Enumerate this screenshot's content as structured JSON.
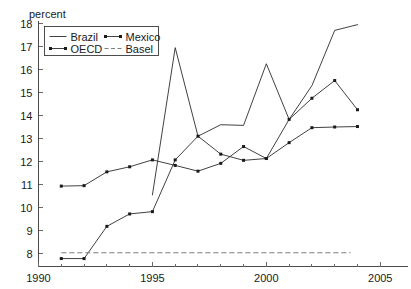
{
  "chart_data": {
    "type": "line",
    "title": "",
    "subtitle": "",
    "xlabel": "",
    "ylabel": "percent",
    "ylabel_position": "top-left",
    "xlim": [
      1990,
      2005.8
    ],
    "ylim": [
      7.55,
      18.15
    ],
    "yticks": [
      8,
      9,
      10,
      11,
      12,
      13,
      14,
      15,
      16,
      17,
      18
    ],
    "ytick_labels": [
      "8",
      "9",
      "10",
      "11",
      "12",
      "13",
      "14",
      "15",
      "16",
      "17",
      "18"
    ],
    "xticks": [
      1990,
      1995,
      2000,
      2005
    ],
    "xtick_labels": [
      "1990",
      "1995",
      "2000",
      "2005"
    ],
    "xticks_minor": [
      1991,
      1992,
      1993,
      1994,
      1996,
      1997,
      1998,
      1999,
      2001,
      2002,
      2003,
      2004
    ],
    "grid": false,
    "legend_position": "top-left-inside",
    "series": [
      {
        "name": "Brazil",
        "style": "solid",
        "markers": false,
        "x": [
          1995,
          1996,
          1997,
          1998,
          1999,
          2000,
          2001,
          2002,
          2003,
          2004
        ],
        "values": [
          10.55,
          16.95,
          13.1,
          13.6,
          13.57,
          16.25,
          13.83,
          15.3,
          17.7,
          17.95
        ]
      },
      {
        "name": "Mexico",
        "style": "solid",
        "markers": true,
        "x": [
          1991,
          1992,
          1993,
          1994,
          1995,
          1996,
          1997,
          1998,
          1999,
          2000,
          2001,
          2002,
          2003,
          2004
        ],
        "values": [
          7.78,
          7.78,
          9.18,
          9.72,
          9.82,
          12.07,
          13.1,
          12.32,
          12.05,
          12.13,
          13.83,
          14.75,
          15.52,
          14.25
        ]
      },
      {
        "name": "OECD",
        "style": "solid",
        "markers": true,
        "x": [
          1991,
          1992,
          1993,
          1994,
          1995,
          1996,
          1997,
          1998,
          1999,
          2000,
          2001,
          2002,
          2003,
          2004
        ],
        "values": [
          10.93,
          10.95,
          11.55,
          11.77,
          12.07,
          11.83,
          11.58,
          11.92,
          12.65,
          12.13,
          12.82,
          13.47,
          13.5,
          13.52
        ]
      },
      {
        "name": "Basel",
        "style": "dashed",
        "markers": false,
        "x": [
          1991,
          2003.7
        ],
        "values": [
          8.03,
          8.03
        ]
      }
    ]
  },
  "legend": {
    "entries": [
      {
        "label": "Brazil",
        "style": "solid",
        "markers": false
      },
      {
        "label": "Mexico",
        "style": "solid",
        "markers": true
      },
      {
        "label": "OECD",
        "style": "solid",
        "markers": true
      },
      {
        "label": "Basel",
        "style": "dashed",
        "markers": false
      }
    ]
  }
}
